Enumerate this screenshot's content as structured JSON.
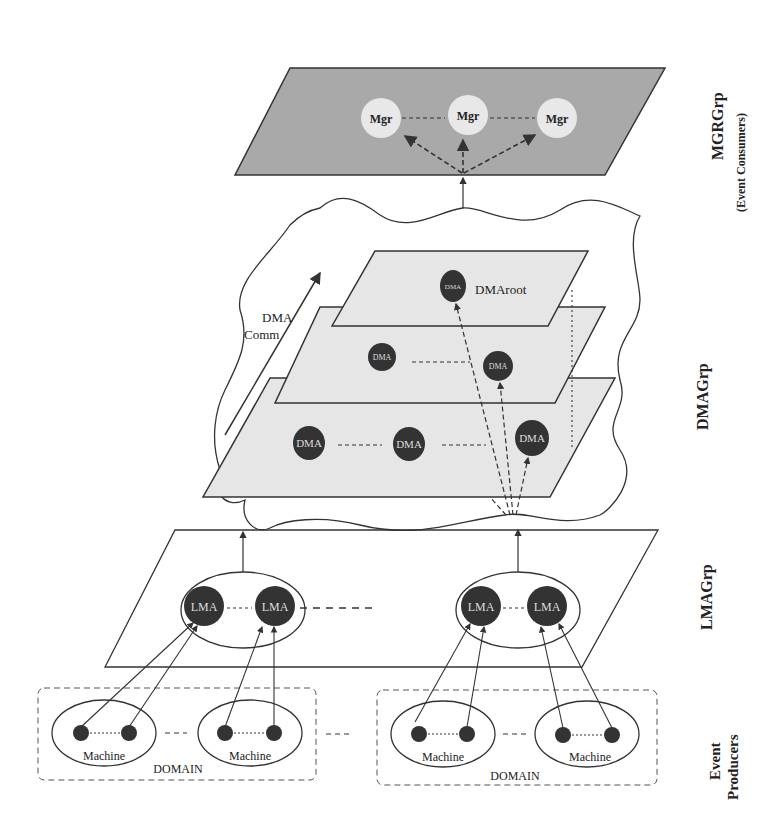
{
  "layers": {
    "mgr": {
      "label": "MGRGrp",
      "sublabel": "(Event Consumers)",
      "nodes": [
        "Mgr",
        "Mgr",
        "Mgr"
      ],
      "fill": "#a9a9a9"
    },
    "dma": {
      "label": "DMAGrp",
      "comm_label_line1": "DMA",
      "comm_label_line2": "Comm",
      "root_label": "DMAroot",
      "root_node": "DMA",
      "mid_nodes": [
        "DMA",
        "DMA"
      ],
      "bottom_nodes": [
        "DMA",
        "DMA",
        "DMA"
      ],
      "fill": "#e6e6e6"
    },
    "lma": {
      "label": "LMAGrp",
      "group_left": [
        "LMA",
        "LMA"
      ],
      "group_right": [
        "LMA",
        "LMA"
      ]
    },
    "producers": {
      "label_line1": "Event",
      "label_line2": "Producers",
      "domains": [
        {
          "label": "DOMAIN",
          "machines": [
            "Machine",
            "Machine"
          ]
        },
        {
          "label": "DOMAIN",
          "machines": [
            "Machine",
            "Machine"
          ]
        }
      ]
    }
  },
  "colors": {
    "node_dark": "#333333",
    "node_light": "#e8e8e8",
    "line": "#333333",
    "text_on_dark": "#dddddd"
  }
}
